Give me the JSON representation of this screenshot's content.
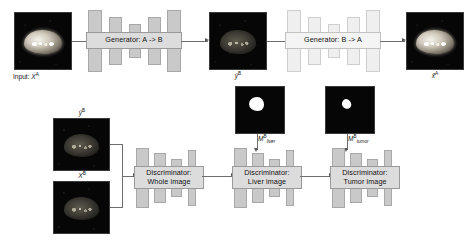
{
  "figure": {
    "type": "architecture-diagram",
    "background_color": "#ffffff",
    "block_fill_dark": "#c9c9c9",
    "block_fill_light": "#efefef",
    "label_fill_dark": "#dcdcdc",
    "label_fill_light": "#f4f4f4",
    "connector_color": "#6e6e6e"
  },
  "top_row": {
    "input_image": {
      "caption_prefix": "Input: ",
      "caption_symbol": "X",
      "caption_superscript": "A",
      "appearance": "bright-abdominal-mri"
    },
    "generator_ab": {
      "label": "Generator: A -> B",
      "style": "dark",
      "shape": "encoder-decoder-hourglass",
      "bar_count": 5
    },
    "translated_image": {
      "caption_symbol": "ŷ",
      "caption_superscript": "B",
      "appearance": "dim-abdominal-mri"
    },
    "generator_ba": {
      "label": "Generator: B -> A",
      "style": "light",
      "shape": "encoder-decoder-hourglass",
      "bar_count": 5
    },
    "reconstructed_image": {
      "caption_symbol": "x̂",
      "caption_superscript": "A",
      "appearance": "bright-abdominal-mri"
    }
  },
  "bottom_row": {
    "fake_image": {
      "caption_symbol": "ŷ",
      "caption_superscript": "B",
      "appearance": "dim-abdominal-mri"
    },
    "real_image": {
      "caption_symbol": "X",
      "caption_superscript": "B",
      "appearance": "dim-abdominal-mri"
    },
    "discriminators": [
      {
        "label": "Discriminator:\nWhole image",
        "name": "whole-image",
        "shape": "descending-staircase",
        "bar_count": 4
      },
      {
        "label": "Discriminator:\nLiver image",
        "name": "liver-image",
        "shape": "descending-staircase",
        "bar_count": 4
      },
      {
        "label": "Discriminator:\nTumor image",
        "name": "tumor-image",
        "shape": "descending-staircase",
        "bar_count": 4
      }
    ],
    "masks": [
      {
        "caption_symbol": "M",
        "caption_superscript": "B",
        "caption_subscript": "liver",
        "appearance": "binary-mask-large-blob"
      },
      {
        "caption_symbol": "M",
        "caption_superscript": "B",
        "caption_subscript": "tumor",
        "appearance": "binary-mask-small-blob"
      }
    ]
  }
}
